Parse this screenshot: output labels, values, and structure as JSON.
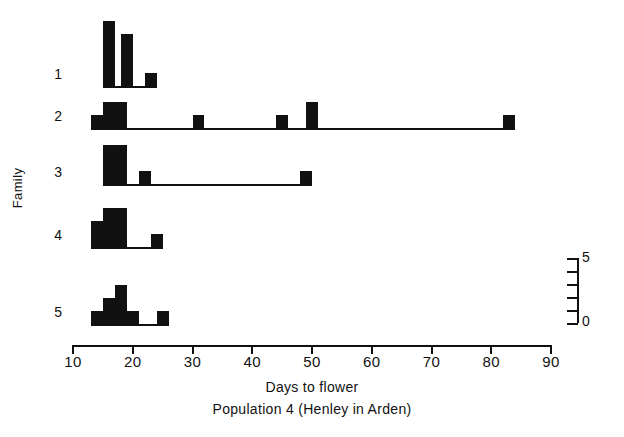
{
  "chart_data": {
    "type": "bar",
    "title": "",
    "xlabel": "Days to flower",
    "caption": "Population 4 (Henley in Arden)",
    "ylabel": "Family",
    "xlim": [
      10,
      90
    ],
    "xticks": [
      10,
      20,
      30,
      40,
      50,
      60,
      70,
      80,
      90
    ],
    "xticklabels": [
      "10",
      "20",
      "30",
      "40",
      "50",
      "60",
      "70",
      "80",
      "90"
    ],
    "grid": false,
    "legend": false,
    "count_scale": {
      "label_top": "5",
      "label_bottom": "0",
      "min": 0,
      "max": 5,
      "ticks": [
        0,
        1,
        2,
        3,
        4,
        5
      ]
    },
    "bin_width": 2,
    "note": "Each family row is a separate histogram of days to flower; bar heights are counts read against the 0-5 scale bar at right.",
    "series": [
      {
        "name": "1",
        "row_label": "1",
        "bins": [
          {
            "start": 15,
            "end": 17,
            "count": 5
          },
          {
            "start": 18,
            "end": 20,
            "count": 4
          },
          {
            "start": 22,
            "end": 24,
            "count": 1
          }
        ]
      },
      {
        "name": "2",
        "row_label": "2",
        "bins": [
          {
            "start": 13,
            "end": 15,
            "count": 1
          },
          {
            "start": 15,
            "end": 19,
            "count": 2
          },
          {
            "start": 30,
            "end": 32,
            "count": 1
          },
          {
            "start": 44,
            "end": 46,
            "count": 1
          },
          {
            "start": 49,
            "end": 51,
            "count": 2
          },
          {
            "start": 82,
            "end": 84,
            "count": 1
          }
        ]
      },
      {
        "name": "3",
        "row_label": "3",
        "bins": [
          {
            "start": 15,
            "end": 19,
            "count": 3
          },
          {
            "start": 21,
            "end": 23,
            "count": 1
          },
          {
            "start": 48,
            "end": 50,
            "count": 1
          }
        ]
      },
      {
        "name": "4",
        "row_label": "4",
        "bins": [
          {
            "start": 13,
            "end": 15,
            "count": 2
          },
          {
            "start": 15,
            "end": 19,
            "count": 3
          },
          {
            "start": 23,
            "end": 25,
            "count": 1
          }
        ]
      },
      {
        "name": "5",
        "row_label": "5",
        "bins": [
          {
            "start": 13,
            "end": 15,
            "count": 1
          },
          {
            "start": 15,
            "end": 17,
            "count": 2
          },
          {
            "start": 17,
            "end": 19,
            "count": 3
          },
          {
            "start": 19,
            "end": 21,
            "count": 1
          },
          {
            "start": 24,
            "end": 26,
            "count": 1
          }
        ]
      }
    ]
  }
}
